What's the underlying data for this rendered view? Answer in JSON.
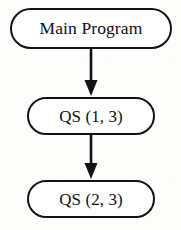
{
  "diagram": {
    "background_color": "#fdfdfc",
    "stroke_color": "#131313",
    "text_color": "#111111",
    "nodes": [
      {
        "id": "main",
        "label": "Main Program",
        "shape": "rounded-rectangle"
      },
      {
        "id": "qs13",
        "label": "QS (1, 3)",
        "shape": "rounded-rectangle"
      },
      {
        "id": "qs23",
        "label": "QS (2, 3)",
        "shape": "rounded-rectangle"
      }
    ],
    "edges": [
      {
        "id": "edge-main-to-qs13",
        "from": "main",
        "to": "qs13",
        "direction": "down",
        "arrowhead": "filled-triangle"
      },
      {
        "id": "edge-qs13-to-qs23",
        "from": "qs13",
        "to": "qs23",
        "direction": "down",
        "arrowhead": "filled-triangle"
      }
    ]
  }
}
